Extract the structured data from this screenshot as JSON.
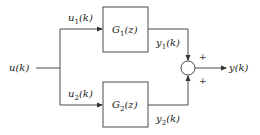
{
  "diagram": {
    "type": "parallel block diagram",
    "input": {
      "label": "u(k)"
    },
    "branches": [
      {
        "input_label": "u",
        "input_sub": "1",
        "input_tail": "(k)",
        "block_main": "G",
        "block_sub": "1",
        "block_tail": "(z)",
        "output_label": "y",
        "output_sub": "1",
        "output_tail": "(k)",
        "sign": "+"
      },
      {
        "input_label": "u",
        "input_sub": "2",
        "input_tail": "(k)",
        "block_main": "G",
        "block_sub": "2",
        "block_tail": "(z)",
        "output_label": "y",
        "output_sub": "2",
        "output_tail": "(k)",
        "sign": "+"
      }
    ],
    "summing_junction": {
      "label": "sum"
    },
    "output": {
      "label": "y(k)"
    },
    "colors": {
      "line": "#4a4a4a",
      "text": "#222222",
      "background": "#ffffff"
    }
  }
}
